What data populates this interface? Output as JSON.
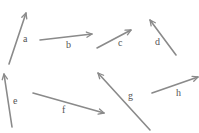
{
  "diagram": {
    "stroke_color": "#8a8a8a",
    "label_color": "#555555",
    "vectors": [
      {
        "label": "a",
        "tail": [
          9,
          64
        ],
        "head": [
          26,
          13
        ],
        "label_pos": [
          23,
          42
        ]
      },
      {
        "label": "b",
        "tail": [
          40,
          40
        ],
        "head": [
          92,
          34
        ],
        "label_pos": [
          66,
          48
        ]
      },
      {
        "label": "c",
        "tail": [
          97,
          48
        ],
        "head": [
          131,
          30
        ],
        "label_pos": [
          118,
          46
        ]
      },
      {
        "label": "d",
        "tail": [
          176,
          55
        ],
        "head": [
          150,
          20
        ],
        "label_pos": [
          155,
          45
        ]
      },
      {
        "label": "e",
        "tail": [
          12,
          127
        ],
        "head": [
          4,
          74
        ],
        "label_pos": [
          13,
          104
        ]
      },
      {
        "label": "f",
        "tail": [
          33,
          93
        ],
        "head": [
          104,
          113
        ],
        "label_pos": [
          62,
          113
        ]
      },
      {
        "label": "g",
        "tail": [
          150,
          130
        ],
        "head": [
          98,
          73
        ],
        "label_pos": [
          128,
          99
        ]
      },
      {
        "label": "h",
        "tail": [
          152,
          93
        ],
        "head": [
          198,
          77
        ],
        "label_pos": [
          176,
          96
        ]
      }
    ]
  }
}
